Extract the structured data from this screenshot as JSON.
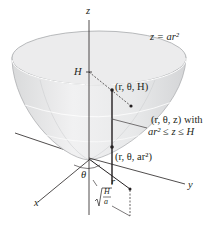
{
  "figure": {
    "surface_equation": "z = ar²",
    "labels": {
      "z_axis": "z",
      "x_axis": "x",
      "y_axis": "y",
      "height_mark": "H",
      "point_top": "(r, θ, H)",
      "point_mid_line1": "(r, θ, z) with",
      "point_mid_line2": "ar² ≤ z ≤ H",
      "point_bottom": "(r, θ, ar²)",
      "angle": "θ",
      "radius": "r",
      "radius_limit": "√(H/a)",
      "radius_limit_num": "H",
      "radius_limit_den": "a"
    },
    "colors": {
      "surface_fill": "#e6e7e8",
      "surface_edge": "#a7a9ac",
      "axis": "#231f20",
      "text": "#231f20"
    }
  }
}
